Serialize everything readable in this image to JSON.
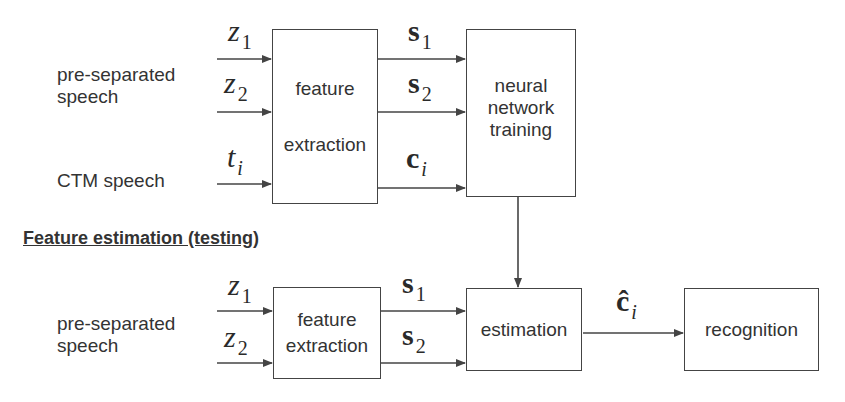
{
  "diagram": {
    "training": {
      "inputs": {
        "group1_label_line1": "pre-separated",
        "group1_label_line2": "speech",
        "group2_label": "CTM speech"
      },
      "signals_in": {
        "z1": {
          "base": "z",
          "sub": "1"
        },
        "z2": {
          "base": "z",
          "sub": "2"
        },
        "ti": {
          "base": "t",
          "sub": "i"
        }
      },
      "feature_extraction_box": {
        "line1": "feature",
        "line2": "extraction"
      },
      "signals_out": {
        "s1": {
          "base": "s",
          "sub": "1"
        },
        "s2": {
          "base": "s",
          "sub": "2"
        },
        "ci": {
          "base": "c",
          "sub": "i"
        }
      },
      "nn_box": {
        "line1": "neural",
        "line2": "network",
        "line3": "training"
      }
    },
    "testing": {
      "heading": "Feature estimation (testing)",
      "inputs": {
        "group1_label_line1": "pre-separated",
        "group1_label_line2": "speech"
      },
      "signals_in": {
        "z1": {
          "base": "z",
          "sub": "1"
        },
        "z2": {
          "base": "z",
          "sub": "2"
        }
      },
      "feature_extraction_box": {
        "line1": "feature",
        "line2": "extraction"
      },
      "signals_out": {
        "s1": {
          "base": "s",
          "sub": "1"
        },
        "s2": {
          "base": "s",
          "sub": "2"
        }
      },
      "estimation_box": {
        "label": "estimation"
      },
      "estimate_signal": {
        "base": "ĉ",
        "sub": "i"
      },
      "recognition_box": {
        "label": "recognition"
      }
    },
    "colors": {
      "line": "#444444",
      "text": "#333333",
      "background": "#ffffff"
    }
  }
}
